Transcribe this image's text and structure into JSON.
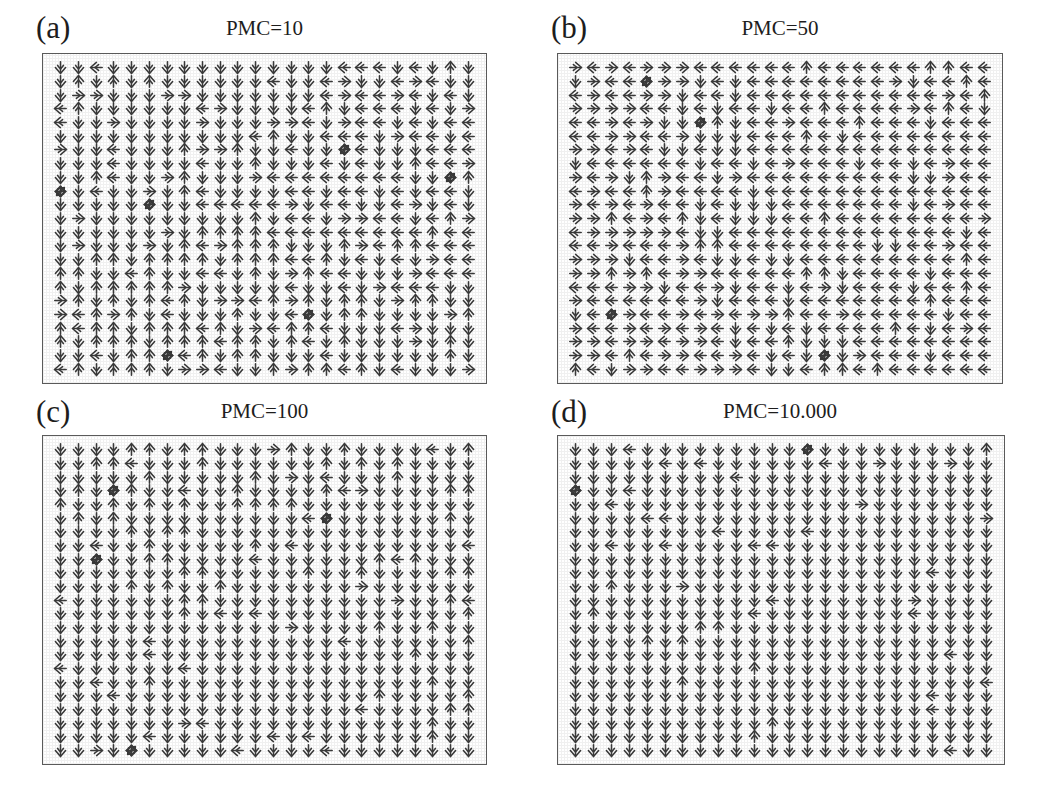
{
  "figure": {
    "type": "vector-field-grid",
    "background_color": "#ffffff",
    "arrow_color": "#3b3b3b",
    "frame_color": "#5a5a5a"
  },
  "chart_data": {
    "type": "quiver",
    "title": "",
    "xlabel": "",
    "ylabel": "",
    "grid": false,
    "legend": null,
    "panels": [
      {
        "id": "a",
        "label": "(a)",
        "title": "PMC=10",
        "grid_cols": 24,
        "grid_rows": 23,
        "order_parameter_note": "highly disordered, mixed directions",
        "direction_mix": {
          "up": 0.22,
          "down": 0.27,
          "left": 0.26,
          "right": 0.25
        },
        "defect_count": 6
      },
      {
        "id": "b",
        "label": "(b)",
        "title": "PMC=50",
        "grid_cols": 24,
        "grid_rows": 23,
        "order_parameter_note": "partially ordered, left/down domains forming",
        "direction_mix": {
          "up": 0.16,
          "down": 0.31,
          "left": 0.38,
          "right": 0.15
        },
        "defect_count": 4
      },
      {
        "id": "c",
        "label": "(c)",
        "title": "PMC=100",
        "grid_cols": 24,
        "grid_rows": 23,
        "order_parameter_note": "mostly down with left-pointing domain",
        "direction_mix": {
          "up": 0.05,
          "down": 0.62,
          "left": 0.23,
          "right": 0.1
        },
        "defect_count": 4
      },
      {
        "id": "d",
        "label": "(d)",
        "title": "PMC=10.000",
        "grid_cols": 24,
        "grid_rows": 23,
        "order_parameter_note": "nearly fully ordered, aligned downward",
        "direction_mix": {
          "up": 0.02,
          "down": 0.9,
          "left": 0.05,
          "right": 0.03
        },
        "defect_count": 2
      }
    ]
  }
}
